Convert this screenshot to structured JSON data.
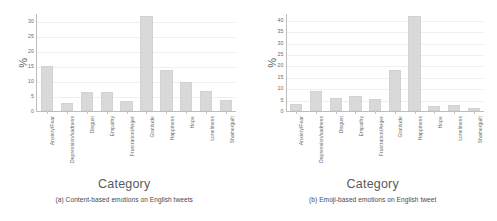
{
  "figure": {
    "background": "#ffffff",
    "bar_color": "#d9d9d9",
    "grid_color": "#efefef",
    "axis_color": "#bdbdbd",
    "text_color": "#6b6b6b"
  },
  "chart_data": [
    {
      "type": "bar",
      "id": "content-based",
      "title": "",
      "caption": "(a) Content-based emotions on English tweets",
      "xlabel": "Category",
      "ylabel": "%",
      "ylim": [
        0,
        32.5
      ],
      "yticks": [
        0,
        5,
        10,
        15,
        20,
        25,
        30
      ],
      "grid": true,
      "legend": null,
      "categories": [
        "Anxiety/Fear",
        "Depression/sadness",
        "Disgust",
        "Empathy",
        "Frustration/Anger",
        "Gratitude",
        "Happiness",
        "Hope",
        "Loneliness",
        "Shame/guilt"
      ],
      "values": [
        15.0,
        2.8,
        6.2,
        6.2,
        3.4,
        31.5,
        13.5,
        9.5,
        6.6,
        3.5
      ]
    },
    {
      "type": "bar",
      "id": "emoji-based",
      "title": "",
      "caption": "(b) Emoji-based emotions on English tweet",
      "xlabel": "Category",
      "ylabel": "%",
      "ylim": [
        0,
        43
      ],
      "yticks": [
        0,
        5,
        10,
        15,
        20,
        25,
        30,
        35,
        40
      ],
      "grid": true,
      "legend": null,
      "categories": [
        "Anxiety/Fear",
        "Depression/sadness",
        "Disgust",
        "Empathy",
        "Frustration/Anger",
        "Gratitude",
        "Happiness",
        "Hope",
        "Loneliness",
        "Shame/guilt"
      ],
      "values": [
        3.0,
        8.8,
        5.6,
        6.8,
        5.4,
        18.2,
        41.5,
        2.3,
        2.6,
        1.5
      ]
    }
  ]
}
